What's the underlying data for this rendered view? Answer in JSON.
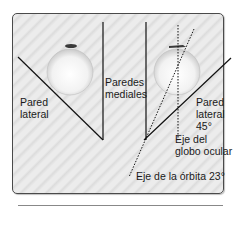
{
  "figure": {
    "labels": {
      "left_lateral_wall": "Pared\nlateral",
      "medial_walls": "Paredes\nmediales",
      "right_lateral_wall": "Pared\nlateral\n45°",
      "eyeball_axis": "Eje del\nglobo ocular",
      "orbit_axis": "Eje de la órbita 23°"
    },
    "colors": {
      "background": "#e6e6e6",
      "lines": "#111111",
      "eyeball": "#f4f4f4",
      "muscle_mark": "#333333"
    },
    "angles": {
      "lateral_wall": "45°",
      "orbit_axis": "23°"
    }
  }
}
